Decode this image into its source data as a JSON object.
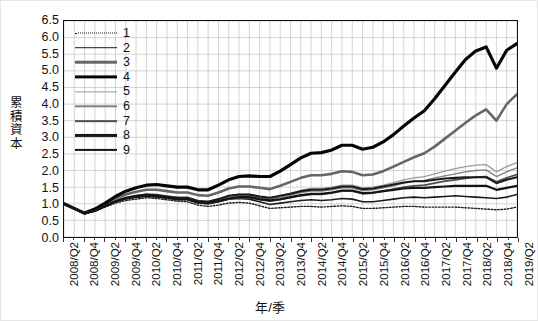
{
  "chart_data": {
    "type": "line",
    "title": "",
    "xlabel": "年/季",
    "ylabel": "累積資本",
    "ylim": [
      0.0,
      6.5
    ],
    "ytick_step": 0.5,
    "yticks": [
      "6.5",
      "6.0",
      "5.5",
      "5.0",
      "4.5",
      "4.0",
      "3.5",
      "3.0",
      "2.5",
      "2.0",
      "1.5",
      "1.0",
      "0.5",
      "0.0"
    ],
    "grid": true,
    "legend_position": "upper-left-inside",
    "x": [
      "2008/Q2",
      "2008/Q3",
      "2008/Q4",
      "2009/Q1",
      "2009/Q2",
      "2009/Q3",
      "2009/Q4",
      "2010/Q1",
      "2010/Q2",
      "2010/Q3",
      "2010/Q4",
      "2011/Q1",
      "2011/Q2",
      "2011/Q3",
      "2011/Q4",
      "2012/Q1",
      "2012/Q2",
      "2012/Q3",
      "2012/Q4",
      "2013/Q1",
      "2013/Q2",
      "2013/Q3",
      "2013/Q4",
      "2014/Q1",
      "2014/Q2",
      "2014/Q3",
      "2014/Q4",
      "2015/Q1",
      "2015/Q2",
      "2015/Q3",
      "2015/Q4",
      "2016/Q1",
      "2016/Q2",
      "2016/Q3",
      "2016/Q4",
      "2017/Q1",
      "2017/Q2",
      "2017/Q3",
      "2017/Q4",
      "2018/Q1",
      "2018/Q2",
      "2018/Q3",
      "2018/Q4",
      "2019/Q1",
      "2019/Q2"
    ],
    "xtick_labels": [
      "2008/Q2",
      "2008/Q4",
      "2009/Q2",
      "2009/Q4",
      "2010/Q2",
      "2010/Q4",
      "2011/Q2",
      "2011/Q4",
      "2012/Q2",
      "2012/Q4",
      "2013/Q2",
      "2013/Q4",
      "2014/Q2",
      "2014/Q4",
      "2015/Q2",
      "2015/Q4",
      "2016/Q2",
      "2016/Q4",
      "2017/Q2",
      "2017/Q4",
      "2018/Q2",
      "2018/Q4",
      "2019/Q2"
    ],
    "xtick_every": 2,
    "series": [
      {
        "name": "1",
        "color": "#1a1a1a",
        "width": 1.4,
        "dash": "1.6,1.7",
        "values": [
          1.0,
          0.86,
          0.72,
          0.78,
          0.9,
          1.02,
          1.1,
          1.14,
          1.18,
          1.16,
          1.12,
          1.08,
          1.06,
          0.96,
          0.92,
          0.96,
          1.02,
          1.04,
          1.02,
          0.94,
          0.86,
          0.88,
          0.9,
          0.92,
          0.92,
          0.9,
          0.92,
          0.94,
          0.92,
          0.86,
          0.86,
          0.88,
          0.9,
          0.92,
          0.92,
          0.9,
          0.9,
          0.9,
          0.9,
          0.88,
          0.86,
          0.84,
          0.82,
          0.84,
          0.9
        ]
      },
      {
        "name": "2",
        "color": "#1c1c1c",
        "width": 1.6,
        "dash": "",
        "values": [
          1.0,
          0.85,
          0.7,
          0.78,
          0.92,
          1.06,
          1.16,
          1.22,
          1.26,
          1.24,
          1.2,
          1.16,
          1.14,
          1.04,
          1.0,
          1.06,
          1.14,
          1.16,
          1.14,
          1.06,
          0.98,
          1.02,
          1.06,
          1.1,
          1.12,
          1.1,
          1.12,
          1.16,
          1.14,
          1.06,
          1.06,
          1.1,
          1.14,
          1.18,
          1.2,
          1.18,
          1.2,
          1.22,
          1.24,
          1.22,
          1.2,
          1.18,
          1.16,
          1.2,
          1.28
        ]
      },
      {
        "name": "3",
        "color": "#666666",
        "width": 2.6,
        "dash": "",
        "values": [
          1.0,
          0.86,
          0.72,
          0.82,
          0.98,
          1.16,
          1.28,
          1.36,
          1.42,
          1.42,
          1.38,
          1.34,
          1.34,
          1.26,
          1.24,
          1.34,
          1.46,
          1.52,
          1.52,
          1.48,
          1.44,
          1.54,
          1.66,
          1.78,
          1.86,
          1.86,
          1.9,
          1.98,
          1.96,
          1.86,
          1.88,
          1.98,
          2.12,
          2.26,
          2.4,
          2.52,
          2.72,
          2.96,
          3.2,
          3.44,
          3.66,
          3.84,
          3.5,
          4.0,
          4.3
        ]
      },
      {
        "name": "4",
        "color": "#050505",
        "width": 3.2,
        "dash": "",
        "values": [
          1.0,
          0.86,
          0.72,
          0.84,
          1.02,
          1.22,
          1.38,
          1.48,
          1.56,
          1.58,
          1.54,
          1.5,
          1.5,
          1.42,
          1.42,
          1.56,
          1.72,
          1.82,
          1.84,
          1.82,
          1.82,
          1.98,
          2.18,
          2.38,
          2.52,
          2.54,
          2.62,
          2.76,
          2.76,
          2.64,
          2.7,
          2.86,
          3.08,
          3.34,
          3.58,
          3.8,
          4.16,
          4.56,
          4.96,
          5.34,
          5.6,
          5.72,
          5.08,
          5.62,
          5.82
        ]
      },
      {
        "name": "5",
        "color": "#9a9a9a",
        "width": 1.3,
        "dash": "",
        "values": [
          1.0,
          0.86,
          0.72,
          0.8,
          0.94,
          1.08,
          1.18,
          1.24,
          1.3,
          1.28,
          1.24,
          1.2,
          1.2,
          1.1,
          1.08,
          1.14,
          1.24,
          1.28,
          1.28,
          1.22,
          1.18,
          1.24,
          1.32,
          1.4,
          1.46,
          1.46,
          1.5,
          1.56,
          1.56,
          1.48,
          1.5,
          1.56,
          1.64,
          1.72,
          1.78,
          1.82,
          1.9,
          1.98,
          2.06,
          2.12,
          2.16,
          2.18,
          1.96,
          2.12,
          2.24
        ]
      },
      {
        "name": "6",
        "color": "#808080",
        "width": 1.4,
        "dash": "",
        "values": [
          1.0,
          0.86,
          0.72,
          0.8,
          0.94,
          1.08,
          1.18,
          1.24,
          1.28,
          1.26,
          1.22,
          1.18,
          1.18,
          1.08,
          1.06,
          1.12,
          1.2,
          1.24,
          1.24,
          1.18,
          1.14,
          1.2,
          1.26,
          1.34,
          1.38,
          1.38,
          1.42,
          1.48,
          1.48,
          1.4,
          1.42,
          1.48,
          1.54,
          1.62,
          1.68,
          1.7,
          1.78,
          1.84,
          1.9,
          1.96,
          2.0,
          2.02,
          1.82,
          1.96,
          2.08
        ]
      },
      {
        "name": "7",
        "color": "#4d4d4d",
        "width": 1.7,
        "dash": "",
        "values": [
          1.0,
          0.86,
          0.72,
          0.79,
          0.92,
          1.05,
          1.14,
          1.19,
          1.22,
          1.2,
          1.16,
          1.12,
          1.12,
          1.02,
          1.0,
          1.06,
          1.14,
          1.18,
          1.18,
          1.12,
          1.08,
          1.12,
          1.18,
          1.24,
          1.28,
          1.28,
          1.32,
          1.38,
          1.38,
          1.3,
          1.32,
          1.38,
          1.44,
          1.5,
          1.54,
          1.56,
          1.62,
          1.68,
          1.72,
          1.76,
          1.8,
          1.82,
          1.66,
          1.78,
          1.88
        ]
      },
      {
        "name": "8",
        "color": "#1a1a1a",
        "width": 2.1,
        "dash": "",
        "values": [
          1.0,
          0.85,
          0.71,
          0.79,
          0.93,
          1.08,
          1.18,
          1.24,
          1.28,
          1.26,
          1.22,
          1.18,
          1.18,
          1.08,
          1.06,
          1.14,
          1.24,
          1.28,
          1.28,
          1.22,
          1.18,
          1.24,
          1.3,
          1.38,
          1.42,
          1.42,
          1.46,
          1.52,
          1.52,
          1.44,
          1.46,
          1.52,
          1.58,
          1.64,
          1.68,
          1.68,
          1.72,
          1.76,
          1.78,
          1.8,
          1.8,
          1.8,
          1.62,
          1.72,
          1.8
        ]
      },
      {
        "name": "9",
        "color": "#141414",
        "width": 2.2,
        "dash": "",
        "values": [
          1.0,
          0.85,
          0.71,
          0.79,
          0.93,
          1.07,
          1.16,
          1.21,
          1.24,
          1.22,
          1.18,
          1.14,
          1.14,
          1.04,
          1.02,
          1.08,
          1.16,
          1.2,
          1.2,
          1.14,
          1.1,
          1.14,
          1.2,
          1.26,
          1.3,
          1.3,
          1.34,
          1.4,
          1.4,
          1.32,
          1.34,
          1.38,
          1.42,
          1.46,
          1.48,
          1.48,
          1.5,
          1.52,
          1.54,
          1.54,
          1.54,
          1.54,
          1.42,
          1.48,
          1.54
        ]
      }
    ]
  },
  "legend": {
    "items": [
      "1",
      "2",
      "3",
      "4",
      "5",
      "6",
      "7",
      "8",
      "9"
    ]
  },
  "axes": {
    "y_title": "累積資本",
    "x_title": "年/季"
  },
  "colors": {
    "frame": "#111111",
    "grid": "#c9c9c9",
    "background": "#ffffff"
  }
}
